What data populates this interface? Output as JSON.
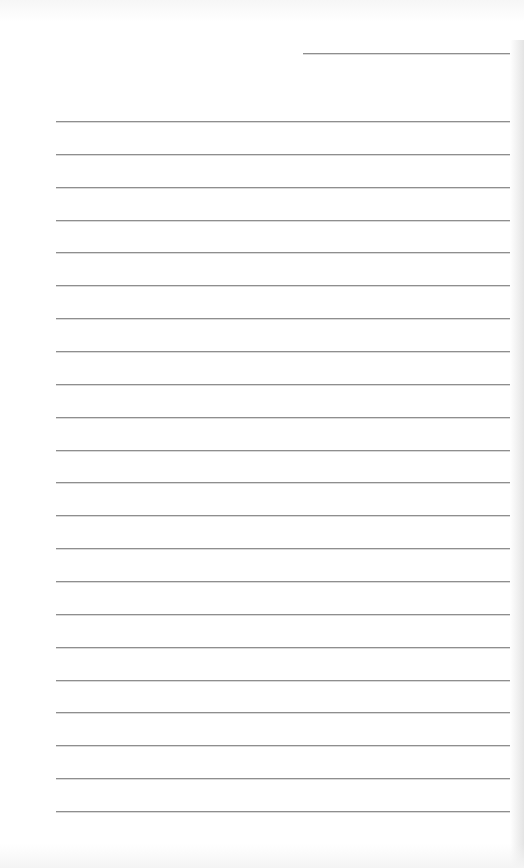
{
  "page": {
    "type": "blank lined sheet",
    "background_color": "#ffffff",
    "line_color": "#8e8e8e",
    "top_line": {
      "y": 53,
      "x_start": 303,
      "x_end": 510
    },
    "ruled_lines": {
      "count": 22,
      "first_y": 121,
      "spacing": 32.86,
      "x_start": 56,
      "x_end": 510
    }
  }
}
